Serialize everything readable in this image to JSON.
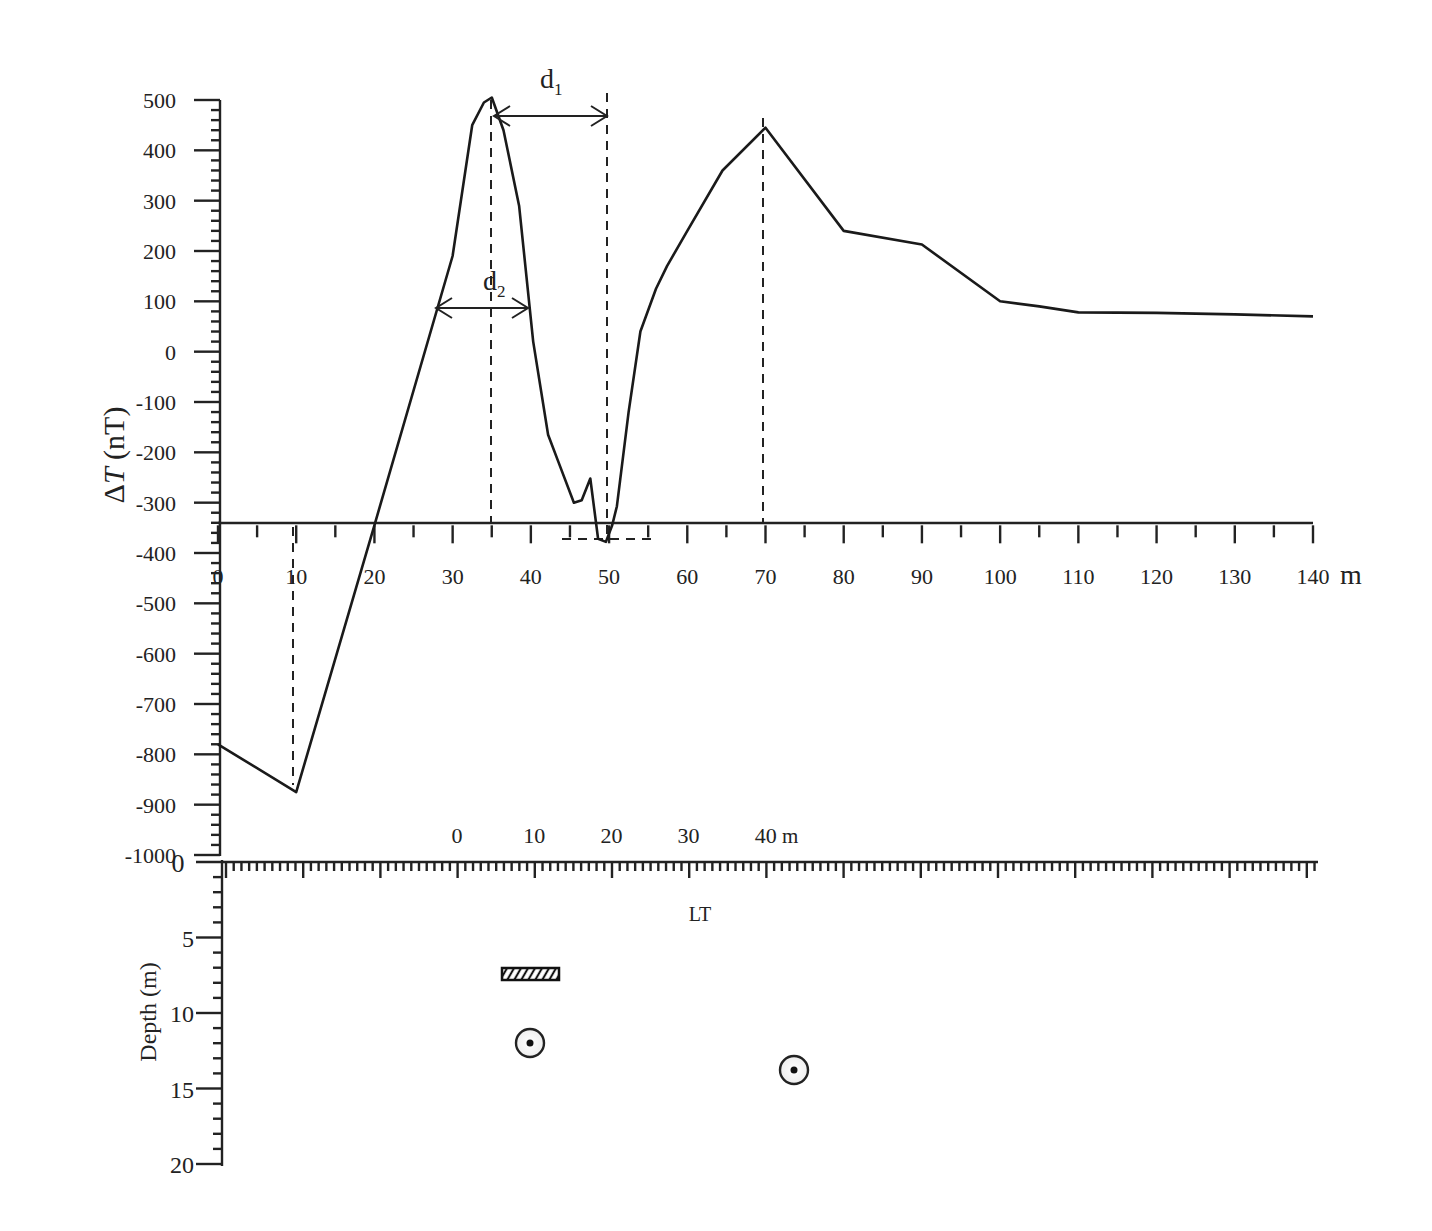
{
  "chart_data": {
    "type": "line",
    "title": "",
    "xlabel": "m",
    "ylabel": "ΔT (nT)",
    "xlim": [
      0,
      140
    ],
    "ylim": [
      -1000,
      500
    ],
    "grid": false,
    "legend": null,
    "x_ticks": [
      0,
      10,
      20,
      30,
      40,
      50,
      60,
      70,
      80,
      90,
      100,
      110,
      120,
      130,
      140
    ],
    "x_tick_labels": [
      "0",
      "10",
      "20",
      "30",
      "40",
      "50",
      "60",
      "70",
      "80",
      "90",
      "100",
      "110",
      "120",
      "130",
      "140"
    ],
    "x_unit_label": "m",
    "x_axis_baseline_value": -345,
    "y_ticks": [
      500,
      400,
      300,
      200,
      100,
      0,
      -100,
      -200,
      -300,
      -400,
      -500,
      -600,
      -700,
      -800,
      -900,
      -1000
    ],
    "y_tick_labels": [
      "500",
      "400",
      "300",
      "200",
      "100",
      "0",
      "-100",
      "-200",
      "-300",
      "-400",
      "-500",
      "-600",
      "-700",
      "-800",
      "-900",
      "-1000"
    ],
    "series": [
      {
        "name": "ΔT profile",
        "x": [
          0,
          10,
          20,
          30,
          32.5,
          34,
          35,
          36.5,
          38.5,
          40.3,
          42.2,
          43.5,
          45.5,
          46.5,
          47.6,
          48.6,
          49.6,
          50.4,
          51,
          52.5,
          54,
          56,
          57.4,
          60,
          64.5,
          70,
          80,
          90,
          100,
          105,
          110,
          120,
          130,
          140
        ],
        "values": [
          -780,
          -875,
          -345,
          190,
          450,
          495,
          505,
          440,
          290,
          20,
          -165,
          -218,
          -300,
          -295,
          -252,
          -372,
          -378,
          -345,
          -307,
          -120,
          40,
          125,
          170,
          240,
          360,
          445,
          240,
          213,
          100,
          90,
          78,
          77,
          74,
          70
        ]
      }
    ],
    "annotations": [
      {
        "type": "dashed_vline",
        "x": 10,
        "label": ""
      },
      {
        "type": "dashed_vline",
        "x": 35,
        "label": ""
      },
      {
        "type": "dashed_vline",
        "x": 50,
        "label": ""
      },
      {
        "type": "dashed_vline",
        "x": 70,
        "label": ""
      },
      {
        "type": "dashed_hline",
        "x_from": 44,
        "x_to": 56,
        "y": -378,
        "label": ""
      },
      {
        "type": "double_arrow",
        "label": "d1",
        "x_from": 35,
        "x_to": 50,
        "y": 465
      },
      {
        "type": "double_arrow",
        "label": "d2",
        "x_from": 28,
        "x_to": 40.3,
        "y": 82
      }
    ],
    "section": {
      "type": "depth_section",
      "ylabel": "Depth (m)",
      "depth_ticks": [
        0,
        5,
        10,
        15,
        20
      ],
      "depth_tick_labels": [
        "0",
        "5",
        "10",
        "15",
        "20"
      ],
      "scale_bar_ticks": [
        0,
        10,
        20,
        30,
        40
      ],
      "scale_bar_labels": [
        "0",
        "10",
        "20",
        "30",
        "40"
      ],
      "scale_bar_unit": "m",
      "label_LT": "LT",
      "objects": [
        {
          "type": "hatched_block",
          "profile_x_from": 36.5,
          "profile_x_to": 43.5,
          "depth": 7.5
        },
        {
          "type": "circle_target",
          "profile_x": 40,
          "depth": 12
        },
        {
          "type": "circle_target",
          "profile_x": 73.5,
          "depth": 13.8
        }
      ]
    }
  },
  "labels": {
    "ylabel_delta": "Δ",
    "ylabel_T": "T",
    "ylabel_unit": " (nT)",
    "x_unit": "m",
    "d1_main": "d",
    "d1_sub": "1",
    "d2_main": "d",
    "d2_sub": "2",
    "depth_label": "Depth (m)",
    "lt_label": "LT",
    "scale_unit": "m",
    "depth_zero": "0"
  }
}
